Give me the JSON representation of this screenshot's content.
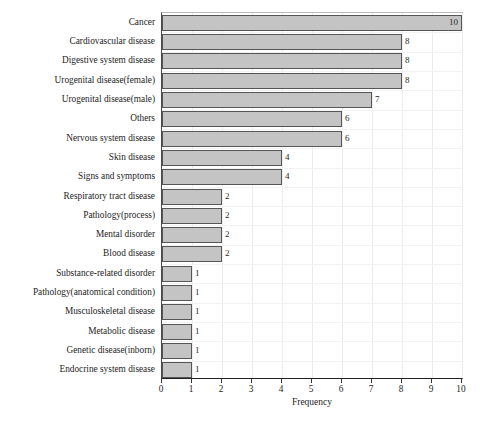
{
  "chart_data": {
    "type": "bar",
    "orientation": "horizontal",
    "title": "",
    "xlabel": "Frequency",
    "ylabel": "",
    "xlim": [
      0,
      10
    ],
    "xticks": [
      0,
      1,
      2,
      3,
      4,
      5,
      6,
      7,
      8,
      9,
      10
    ],
    "grid": true,
    "legend": null,
    "categories": [
      "Cancer",
      "Cardiovascular disease",
      "Digestive system disease",
      "Urogenital disease(female)",
      "Urogenital disease(male)",
      "Others",
      "Nervous system disease",
      "Skin disease",
      "Signs and symptoms",
      "Respiratory tract disease",
      "Pathology(process)",
      "Mental disorder",
      "Blood disease",
      "Substance-related disorder",
      "Pathology(anatomical condition)",
      "Musculoskeletal disease",
      "Metabolic disease",
      "Genetic disease(inborn)",
      "Endocrine system disease"
    ],
    "values": [
      10,
      8,
      8,
      8,
      7,
      6,
      6,
      4,
      4,
      2,
      2,
      2,
      2,
      1,
      1,
      1,
      1,
      1,
      1
    ],
    "value_labels": [
      "10",
      "8",
      "8",
      "8",
      "7",
      "6",
      "6",
      "4",
      "4",
      "2",
      "2",
      "2",
      "2",
      "1",
      "1",
      "1",
      "1",
      "1",
      "1"
    ],
    "colors": {
      "bar_fill": "#c4c4c4",
      "bar_border": "#565656",
      "axis": "#222222",
      "grid": "#ececec",
      "text": "#1d1d1d"
    }
  },
  "axis": {
    "x_title": "Frequency",
    "x_tick_labels": [
      "0",
      "1",
      "2",
      "3",
      "4",
      "5",
      "6",
      "7",
      "8",
      "9",
      "10"
    ]
  },
  "caption": {
    "text": ""
  }
}
